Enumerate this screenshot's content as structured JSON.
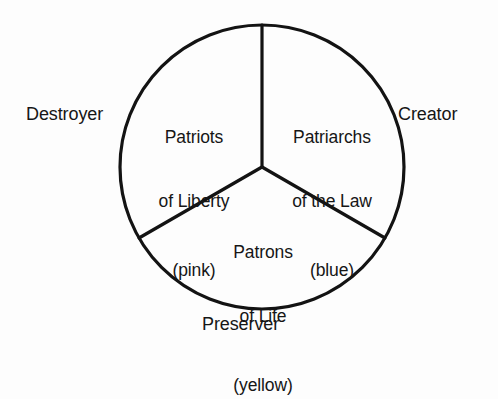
{
  "diagram": {
    "type": "divided-circle",
    "shape_name": "circle",
    "segments": [
      {
        "id": "pink",
        "title_line_1": "Patriots",
        "title_line_2": "of Liberty",
        "color_note": "(pink)",
        "color_word": "pink",
        "outer_label": "Destroyer",
        "outer_label_side": "left"
      },
      {
        "id": "blue",
        "title_line_1": "Patriarchs",
        "title_line_2": "of the Law",
        "color_note": "(blue)",
        "color_word": "blue",
        "outer_label": "Creator",
        "outer_label_side": "right"
      },
      {
        "id": "yellow",
        "title_line_1": "Patrons",
        "title_line_2": "of Life",
        "color_note": "(yellow)",
        "color_word": "yellow",
        "outer_label": "Preserver",
        "outer_label_side": "bottom"
      }
    ],
    "style": {
      "stroke_color": "#131313",
      "background_color": "#fdfdfd",
      "text_color": "#161616"
    }
  }
}
